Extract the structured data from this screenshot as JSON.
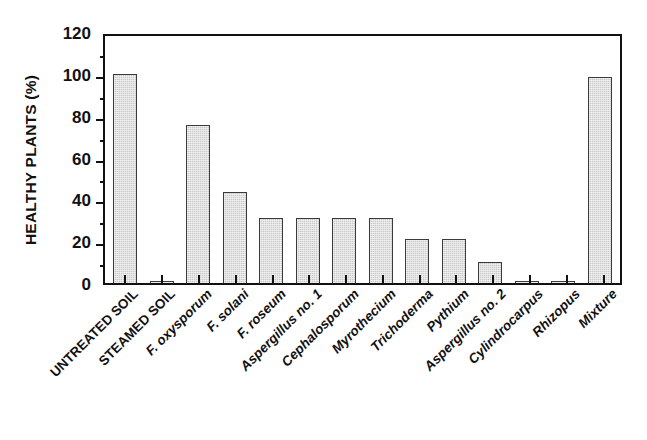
{
  "chart_data": {
    "type": "bar",
    "title": "",
    "xlabel": "",
    "ylabel": "HEALTHY PLANTS (%)",
    "ylim": [
      0,
      120
    ],
    "ytick_labels": [
      "0",
      "20",
      "40",
      "60",
      "80",
      "100",
      "120"
    ],
    "ytick_values": [
      0,
      20,
      40,
      60,
      80,
      100,
      120
    ],
    "yminor_values": [
      10,
      30,
      50,
      70,
      90,
      110
    ],
    "grid": false,
    "legend": "none",
    "categories": [
      "UNTREATED SOIL",
      "STEAMED SOIL",
      "F. oxysporum",
      "F. solani",
      "F. roseum",
      "Aspergillus no. 1",
      "Cephalosporum",
      "Myrothecium",
      "Trichoderma",
      "Pythium",
      "Aspergillus no. 2",
      "Cylindrocarpus",
      "Rhizopus",
      "Mixture"
    ],
    "category_styles": [
      "caps",
      "caps",
      "ital",
      "ital",
      "ital",
      "ital",
      "ital",
      "ital",
      "ital",
      "ital",
      "ital",
      "ital",
      "ital",
      "ital"
    ],
    "values": [
      100,
      1,
      75.5,
      43.5,
      31,
      31,
      31,
      31,
      21,
      21,
      10,
      1,
      1,
      98.5
    ],
    "bar_fill_color": "#c9c9c9",
    "bar_edge_color": "#3a3a3a",
    "axis_color": "#111111"
  }
}
